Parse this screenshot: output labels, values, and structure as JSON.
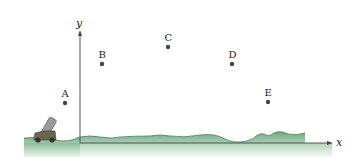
{
  "diagram": {
    "axes": {
      "x_label": "x",
      "y_label": "y",
      "origin_px": [
        80,
        143
      ],
      "x_end_px": 330,
      "y_top_px": 32,
      "color": "#444444"
    },
    "points": [
      {
        "label": "A",
        "px": [
          65,
          103
        ]
      },
      {
        "label": "B",
        "px": [
          102,
          64
        ]
      },
      {
        "label": "C",
        "px": [
          168,
          47
        ]
      },
      {
        "label": "D",
        "px": [
          232,
          64
        ]
      },
      {
        "label": "E",
        "px": [
          268,
          102
        ]
      }
    ],
    "point_color": "#444444",
    "ground": {
      "fill_top": "#7fb48e",
      "fill_bottom": "#e6f1e8",
      "edge": "#4d7d5a"
    },
    "cannon": {
      "body_color": "#6b6650",
      "barrel_color": "#9a9a9a",
      "wheel_color": "#333333"
    }
  }
}
